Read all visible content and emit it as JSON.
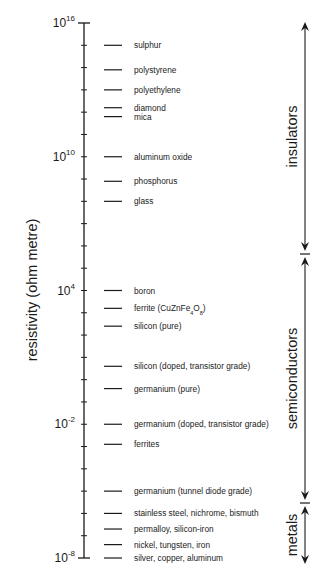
{
  "chart_data": {
    "type": "scatter",
    "title": "",
    "xlabel": "",
    "ylabel": "resistivity (ohm metre)",
    "yscale": "log10",
    "ylim_exponent": [
      -8,
      16
    ],
    "grid": false,
    "y_tick_labels": [
      {
        "base": "10",
        "exp": "16",
        "value_exp": 16
      },
      {
        "base": "10",
        "exp": "10",
        "value_exp": 10
      },
      {
        "base": "10",
        "exp": "4",
        "value_exp": 4
      },
      {
        "base": "10",
        "exp": "-2",
        "value_exp": -2
      },
      {
        "base": "10",
        "exp": "-8",
        "value_exp": -8
      }
    ],
    "minor_ticks_every_decade": true,
    "materials": [
      {
        "name": "sulphur",
        "log_resistivity": 15.0
      },
      {
        "name": "polystyrene",
        "log_resistivity": 13.9
      },
      {
        "name": "polyethylene",
        "log_resistivity": 13.0
      },
      {
        "name": "diamond",
        "log_resistivity": 12.2
      },
      {
        "name": "mica",
        "log_resistivity": 11.8
      },
      {
        "name": "aluminum oxide",
        "log_resistivity": 10.0
      },
      {
        "name": "phosphorus",
        "log_resistivity": 8.9
      },
      {
        "name": "glass",
        "log_resistivity": 8.0
      },
      {
        "name": "boron",
        "log_resistivity": 4.0
      },
      {
        "name": "ferrite (CuZnFe",
        "sub1": "4",
        "mid": "O",
        "sub2": "8",
        "tail": ")",
        "log_resistivity": 3.2
      },
      {
        "name": "silicon (pure)",
        "log_resistivity": 2.4
      },
      {
        "name": "silicon (doped, transistor grade)",
        "log_resistivity": 0.6
      },
      {
        "name": "germanium (pure)",
        "log_resistivity": -0.4
      },
      {
        "name": "germanium (doped, transistor grade)",
        "log_resistivity": -2.0
      },
      {
        "name": "ferrites",
        "log_resistivity": -2.9
      },
      {
        "name": "germanium (tunnel diode grade)",
        "log_resistivity": -5.0
      },
      {
        "name": "stainless steel, nichrome, bismuth",
        "log_resistivity": -6.0
      },
      {
        "name": "permalloy, silicon-iron",
        "log_resistivity": -6.7
      },
      {
        "name": "nickel, tungsten, iron",
        "log_resistivity": -7.4
      },
      {
        "name": "silver, copper, aluminum",
        "log_resistivity": -8.0
      }
    ],
    "classes": [
      {
        "name": "insulators",
        "from_exp": 16,
        "to_exp": 6.3
      },
      {
        "name": "semiconductors",
        "from_exp": 6.3,
        "to_exp": -4.8
      },
      {
        "name": "metals",
        "from_exp": -4.8,
        "to_exp": -8.2
      }
    ],
    "colors": {
      "ink": "#1a1a1a",
      "background": "#ffffff"
    }
  }
}
